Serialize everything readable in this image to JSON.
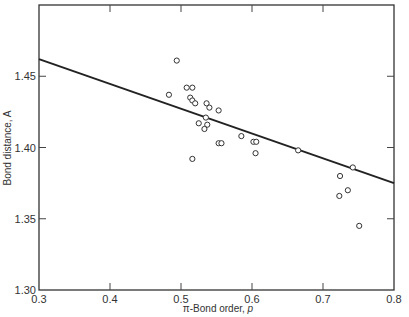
{
  "chart_data": {
    "type": "scatter",
    "title": "",
    "xlabel_prefix": "π-Bond order, ",
    "xlabel_var": "p",
    "ylabel": "Bond distance, A",
    "xlim": [
      0.3,
      0.8
    ],
    "ylim": [
      1.3,
      1.5
    ],
    "xticks": [
      "0.3",
      "0.4",
      "0.5",
      "0.6",
      "0.7",
      "0.8"
    ],
    "xtick_values": [
      0.3,
      0.4,
      0.5,
      0.6,
      0.7,
      0.8
    ],
    "yticks": [
      "1.30",
      "1.35",
      "1.40",
      "1.45"
    ],
    "ytick_values": [
      1.3,
      1.35,
      1.4,
      1.45
    ],
    "grid": false,
    "legend": null,
    "series": [
      {
        "name": "observed",
        "marker": "open-circle",
        "points": [
          [
            0.494,
            1.461
          ],
          [
            0.483,
            1.437
          ],
          [
            0.508,
            1.442
          ],
          [
            0.516,
            1.442
          ],
          [
            0.513,
            1.435
          ],
          [
            0.516,
            1.433
          ],
          [
            0.52,
            1.431
          ],
          [
            0.536,
            1.431
          ],
          [
            0.54,
            1.428
          ],
          [
            0.553,
            1.426
          ],
          [
            0.535,
            1.421
          ],
          [
            0.525,
            1.417
          ],
          [
            0.537,
            1.416
          ],
          [
            0.533,
            1.413
          ],
          [
            0.585,
            1.408
          ],
          [
            0.553,
            1.403
          ],
          [
            0.557,
            1.403
          ],
          [
            0.602,
            1.404
          ],
          [
            0.606,
            1.404
          ],
          [
            0.605,
            1.396
          ],
          [
            0.516,
            1.392
          ],
          [
            0.665,
            1.398
          ],
          [
            0.742,
            1.386
          ],
          [
            0.724,
            1.38
          ],
          [
            0.735,
            1.37
          ],
          [
            0.723,
            1.366
          ],
          [
            0.751,
            1.345
          ]
        ]
      },
      {
        "name": "fit",
        "type": "line",
        "points": [
          [
            0.3,
            1.462
          ],
          [
            0.8,
            1.375
          ]
        ]
      }
    ]
  }
}
